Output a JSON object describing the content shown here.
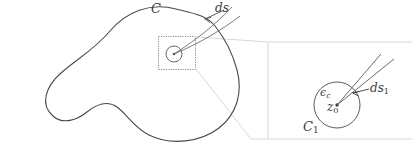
{
  "figure": {
    "width": 412,
    "height": 159,
    "background": "#ffffff",
    "stroke_main": "#4a4a4a",
    "stroke_faint": "#cfcfcf",
    "stroke_thin": "#6a6a6a",
    "text_color": "#3b3b3b"
  },
  "labels": {
    "contour_C": "C",
    "arc_element_ds": "ds",
    "epsilon_base": "ϵ",
    "epsilon_sub": "c",
    "center_point_base": "z",
    "center_point_sub": "0",
    "small_contour_base": "C",
    "small_contour_sub": "1",
    "arc_element_ds1_base": "ds",
    "arc_element_ds1_sub": "1"
  },
  "geometry": {
    "main_contour": {
      "name": "C",
      "description": "closed wavy blob contour",
      "path": "M 176 9 C 150 2 128 12 112 30 C 96 48 78 58 62 72 C 46 86 40 104 52 115 C 62 124 76 120 86 112 C 96 104 106 100 116 106 C 126 112 132 126 148 134 C 170 145 200 142 218 128 C 236 114 242 92 236 70 C 231 51 222 36 214 26 C 205 15 192 13 176 9 Z"
    },
    "inset_box": {
      "name": "magnified-region-box",
      "x": 158,
      "y": 36,
      "width": 37,
      "height": 34,
      "border_style": "dotted"
    },
    "small_circle_left": {
      "cx": 174,
      "cy": 54,
      "r": 8
    },
    "center_dot_left": {
      "cx": 174,
      "cy": 54,
      "r": 1.2
    },
    "ds_wedge_left": {
      "description": "thin wedge from upper-right converging to small circle",
      "line_a": "M 174 54 L 231 7",
      "line_b": "M 174 54 L 237 15"
    },
    "detail_circle": {
      "name": "C1",
      "cx": 337,
      "cy": 105,
      "r": 23
    },
    "center_dot_right": {
      "cx": 337,
      "cy": 105,
      "r": 1.6
    },
    "ds1_wedge_right": {
      "line_a": "M 337 105 L 382 55",
      "line_b": "M 337 105 L 393 60"
    },
    "magnification_frustum": {
      "description": "faint quadrilateral connecting inset box to detail view",
      "edges": [
        "M 195 36 L 268 41",
        "M 195 70 L 250 140",
        "M 268 41 L 412 41",
        "M 250 140 L 412 140",
        "M 268 41 L 268 140"
      ]
    },
    "arrow_ds": {
      "from_x": 225,
      "from_y": 9,
      "to_x": 206,
      "to_y": 18
    },
    "arrow_ds1": {
      "from_x": 369,
      "from_y": 88,
      "to_x": 354,
      "to_y": 93
    }
  }
}
